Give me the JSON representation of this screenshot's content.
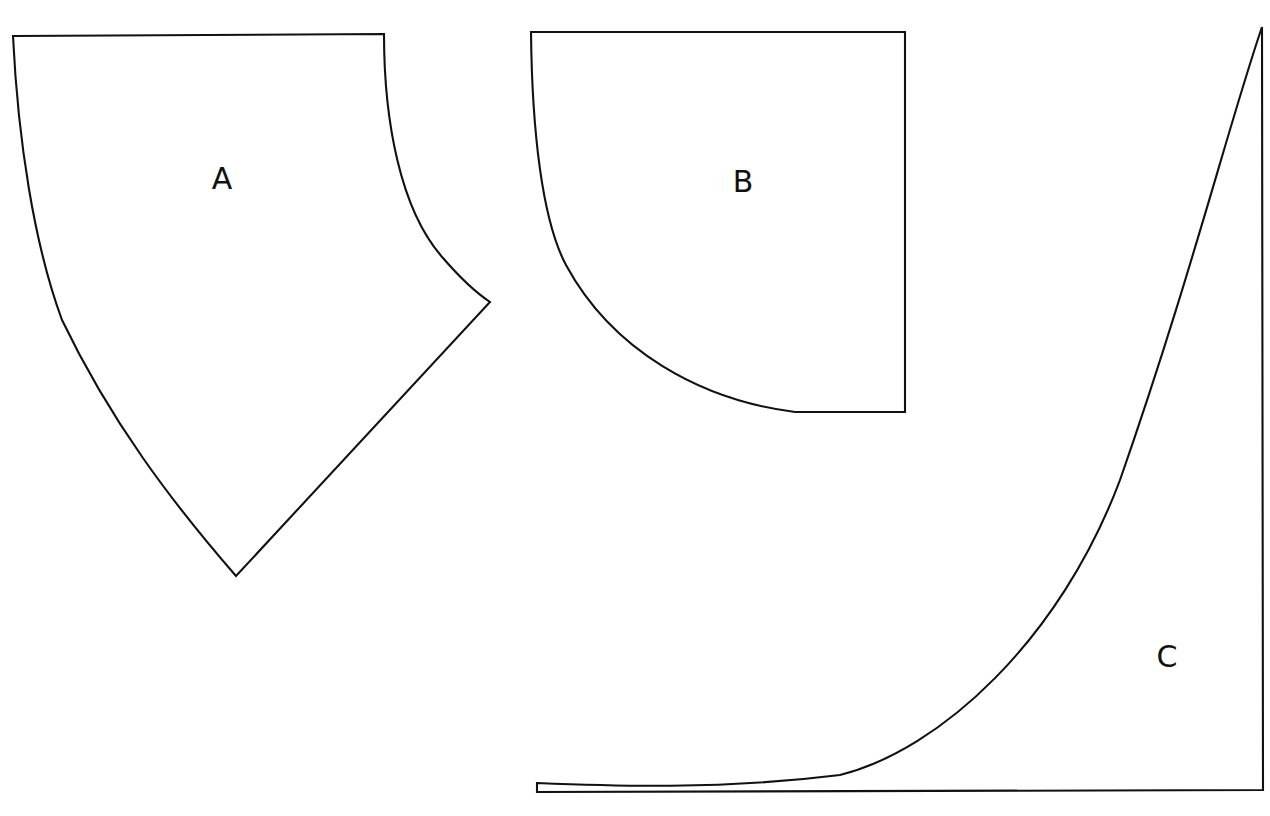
{
  "figure": {
    "background_color": "#ffffff",
    "stroke_color": "#111111",
    "stroke_width": 2.1,
    "canvas": {
      "width": 1270,
      "height": 816
    }
  },
  "regions": [
    {
      "id": "region-a",
      "label": "A",
      "label_position": {
        "x": 222,
        "y": 180
      },
      "description": "Curvilinear pentagon with a flat top edge, a concave right arc, a straight lower-right edge meeting a sharp bottom vertex, and a concave left arc",
      "vertices": {
        "top_left": {
          "x": 13,
          "y": 36
        },
        "top_right": {
          "x": 384,
          "y": 34
        },
        "right_point": {
          "x": 490,
          "y": 302
        },
        "bottom_vertex": {
          "x": 236,
          "y": 576
        }
      },
      "path": "M 13 36 L 384 34 C 384 120 400 210 443 258 C 462 280 478 294 490 302 L 236 576 C 170 500 110 420 62 320 C 34 244 18 140 13 36 Z"
    },
    {
      "id": "region-b",
      "label": "B",
      "label_position": {
        "x": 743,
        "y": 183
      },
      "description": "Quarter-disk sector: flat top edge, vertical right edge, short horizontal bottom edge, and a concave elliptical arc from the top-left corner to the bottom-right",
      "vertices": {
        "top_left": {
          "x": 531,
          "y": 32
        },
        "top_right": {
          "x": 905,
          "y": 32
        },
        "bottom_right": {
          "x": 905,
          "y": 412
        },
        "arc_foot": {
          "x": 795,
          "y": 412
        }
      },
      "path": "M 531 32 L 905 32 L 905 412 L 795 412 C 700 400 612 350 566 265 C 542 220 532 130 531 32 Z"
    },
    {
      "id": "region-c",
      "label": "C",
      "label_position": {
        "x": 1167,
        "y": 658
      },
      "description": "Region under an exponential-type curve: horizontal baseline, vertical right edge, and a rapidly rising concave-up curve on the left",
      "vertices": {
        "baseline_left": {
          "x": 537,
          "y": 792
        },
        "baseline_right": {
          "x": 1263,
          "y": 790
        },
        "top_right": {
          "x": 1262,
          "y": 27
        },
        "curve_start": {
          "x": 537,
          "y": 783
        }
      },
      "path": "M 537 792 L 1263 790 L 1262 27 C 1230 120 1190 280 1120 480 C 1060 640 940 750 840 775 C 720 790 610 786 537 783 Z"
    }
  ]
}
